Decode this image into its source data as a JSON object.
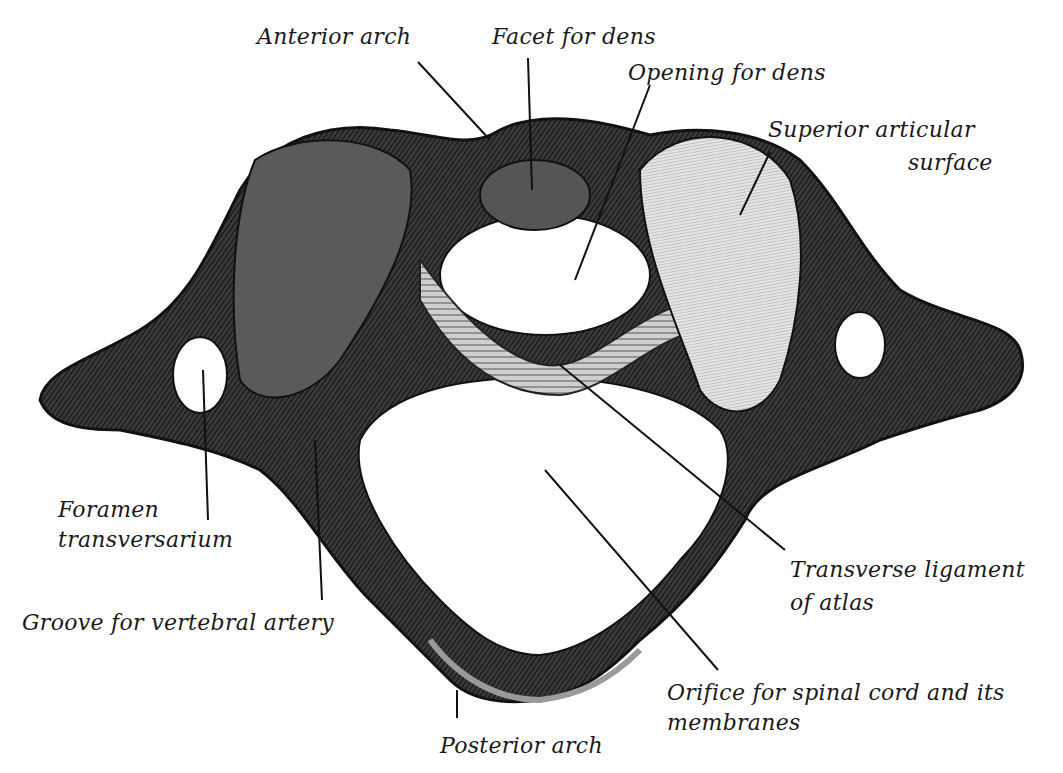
{
  "figure": {
    "labels": {
      "anterior_arch": "Anterior arch",
      "facet_for_dens": "Facet for dens",
      "opening_for_dens": "Opening for dens",
      "superior_articular_surface_line1": "Superior articular",
      "superior_articular_surface_line2": "surface",
      "foramen_transversarium_line1": "Foramen",
      "foramen_transversarium_line2": "transversarium",
      "groove_for_vertebral_artery": "Groove for vertebral artery",
      "transverse_ligament_line1": "Transverse ligament",
      "transverse_ligament_line2": "of atlas",
      "orifice_line1": "Orifice for spinal cord and its",
      "orifice_line2": "membranes",
      "posterior_arch": "Posterior arch"
    },
    "colors": {
      "ink": "#1a1a1a",
      "bone_dark": "#2a2a2a",
      "bone_mid": "#6a6a6a",
      "bone_light": "#d8d8d8",
      "paper": "#ffffff"
    }
  }
}
